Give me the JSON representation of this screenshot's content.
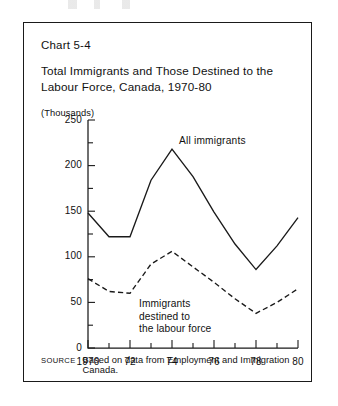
{
  "figure": {
    "chart_number": "Chart 5-4",
    "title": "Total Immigrants and Those Destined to the Labour Force, Canada, 1970-80",
    "units_label": "(Thousands)",
    "source_tag": "SOURCE",
    "source_text": "Based on data from Employment and Immigration Canada."
  },
  "annotations": {
    "all_immigrants": "All  immigrants",
    "destined_line1": "Immigrants",
    "destined_line2": "destined to",
    "destined_line3": "the labour force"
  },
  "chart_data": {
    "type": "line",
    "title": "Total Immigrants and Those Destined to the Labour Force, Canada, 1970-80",
    "xlabel": "",
    "ylabel": "(Thousands)",
    "ylim": [
      0,
      250
    ],
    "xlim": [
      1970,
      1980
    ],
    "ytick_values": [
      0,
      50,
      100,
      150,
      200,
      250
    ],
    "ytick_labels": [
      "0",
      "50",
      "100",
      "150",
      "200",
      "250"
    ],
    "yminor_values": [
      25,
      75,
      125,
      175,
      225
    ],
    "x": [
      1970,
      1971,
      1972,
      1973,
      1974,
      1975,
      1976,
      1977,
      1978,
      1979,
      1980
    ],
    "xtick_values": [
      1970,
      1971,
      1972,
      1973,
      1974,
      1975,
      1976,
      1977,
      1978,
      1979,
      1980
    ],
    "xtick_labels": [
      "1970",
      "",
      "72",
      "",
      "74",
      "",
      "76",
      "",
      "78",
      "",
      "80"
    ],
    "grid": false,
    "legend": "inline-annotations",
    "series": [
      {
        "name": "All immigrants",
        "style": "solid",
        "values": [
          148,
          122,
          122,
          184,
          218,
          188,
          149,
          114,
          86,
          112,
          143
        ]
      },
      {
        "name": "Immigrants destined to the labour force",
        "style": "dashed",
        "values": [
          76,
          62,
          60,
          92,
          106,
          89,
          72,
          54,
          38,
          50,
          65
        ]
      }
    ]
  },
  "colors": {
    "ink": "#1a1a1a",
    "background": "#ffffff"
  }
}
